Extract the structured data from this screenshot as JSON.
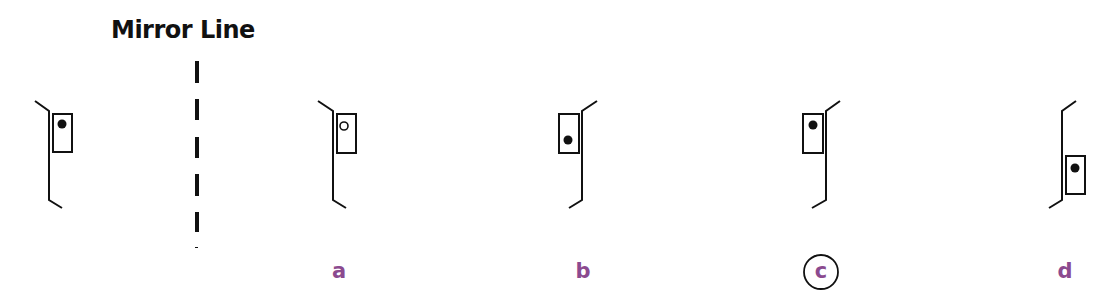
{
  "title": "Mirror Line",
  "colors": {
    "stroke": "#111111",
    "label": "#8B4A8F",
    "background": "#ffffff"
  },
  "original_figure": {
    "description": "Bent vertical line opening to the right with a rectangle on its right side, filled dot near top of rectangle",
    "dot": "filled",
    "rect_side": "right",
    "dot_position": "top"
  },
  "mirror_line": {
    "style": "dashed",
    "orientation": "vertical"
  },
  "options": [
    {
      "label": "a",
      "dot": "hollow",
      "rect_side": "right",
      "rect_position": "top",
      "dot_position": "top",
      "selected": false
    },
    {
      "label": "b",
      "dot": "filled",
      "rect_side": "left",
      "rect_position": "top",
      "dot_position": "bottom",
      "selected": false
    },
    {
      "label": "c",
      "dot": "filled",
      "rect_side": "left",
      "rect_position": "top",
      "dot_position": "top",
      "selected": true
    },
    {
      "label": "d",
      "dot": "filled",
      "rect_side": "right",
      "rect_position": "bottom",
      "dot_position": "top",
      "selected": false
    }
  ],
  "answer": "c"
}
